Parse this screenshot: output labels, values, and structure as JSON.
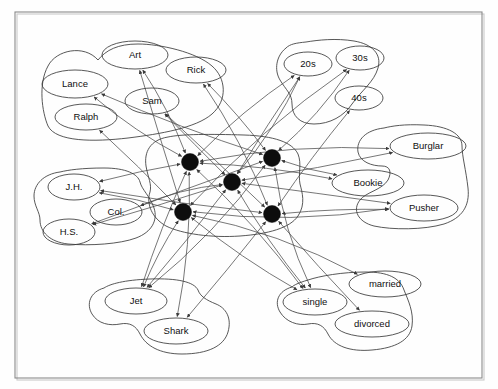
{
  "figure": {
    "frame": {
      "x": 15,
      "y": 12,
      "width": 467,
      "height": 366
    },
    "background_color": "#fefefe",
    "line_color": "#4a4a4a",
    "node_fill_color": "#0d0d0d",
    "ellipse_stroke_color": "#3a3a3a"
  },
  "clusters": [
    {
      "id": "names",
      "name": "name-cluster",
      "hull": "M 98 60 C 84 44 56 50 48 66 C 38 84 42 112 48 126 C 56 142 94 142 128 138 C 160 134 196 128 212 114 C 228 100 226 78 212 66 C 196 52 160 44 138 44 C 118 44 106 50 98 60 Z",
      "nodes": [
        {
          "id": "art",
          "label": "Art",
          "cx": 135,
          "cy": 55,
          "rx": 33,
          "ry": 14
        },
        {
          "id": "rick",
          "label": "Rick",
          "cx": 196,
          "cy": 70,
          "rx": 30,
          "ry": 13
        },
        {
          "id": "lance",
          "label": "Lance",
          "cx": 75,
          "cy": 84,
          "rx": 33,
          "ry": 14
        },
        {
          "id": "sam",
          "label": "Sam",
          "cx": 152,
          "cy": 101,
          "rx": 27,
          "ry": 13
        },
        {
          "id": "ralph",
          "label": "Ralph",
          "cx": 86,
          "cy": 117,
          "rx": 31,
          "ry": 13
        }
      ]
    },
    {
      "id": "age",
      "name": "age-cluster",
      "hull": "M 286 48 C 276 56 274 70 280 80 C 286 90 292 94 292 104 C 292 116 300 124 314 124 C 330 124 344 116 352 104 C 362 90 374 82 378 68 C 382 54 372 44 354 41 C 336 38 318 40 306 42 C 296 43 290 44 286 48 Z",
      "nodes": [
        {
          "id": "20s",
          "label": "20s",
          "cx": 308,
          "cy": 64,
          "rx": 24,
          "ry": 12
        },
        {
          "id": "30s",
          "label": "30s",
          "cx": 360,
          "cy": 58,
          "rx": 24,
          "ry": 12
        },
        {
          "id": "40s",
          "label": "40s",
          "cx": 359,
          "cy": 98,
          "rx": 24,
          "ry": 12
        }
      ]
    },
    {
      "id": "occupation",
      "name": "occupation-cluster",
      "hull": "M 384 128 C 366 130 356 140 358 152 C 360 162 372 166 382 166 C 390 166 392 172 388 180 C 382 190 366 192 360 200 C 352 210 358 222 374 226 C 392 230 424 230 444 224 C 462 218 470 206 468 188 C 466 170 462 156 462 146 C 462 134 448 126 424 125 C 404 124 392 126 384 128 Z",
      "nodes": [
        {
          "id": "burglar",
          "label": "Burglar",
          "cx": 428,
          "cy": 146,
          "rx": 38,
          "ry": 13
        },
        {
          "id": "bookie",
          "label": "Bookie",
          "cx": 368,
          "cy": 183,
          "rx": 36,
          "ry": 13
        },
        {
          "id": "pusher",
          "label": "Pusher",
          "cx": 424,
          "cy": 208,
          "rx": 34,
          "ry": 13
        }
      ]
    },
    {
      "id": "education",
      "name": "education-cluster",
      "hull": "M 60 172 C 44 174 34 184 34 196 C 34 206 40 212 40 220 C 40 232 50 242 68 244 C 90 246 120 244 136 238 C 152 232 158 220 154 208 C 150 196 142 190 140 182 C 138 174 126 168 104 168 C 82 168 68 170 60 172 Z",
      "nodes": [
        {
          "id": "jh",
          "label": "J.H.",
          "cx": 74,
          "cy": 187,
          "rx": 26,
          "ry": 13
        },
        {
          "id": "col",
          "label": "Col.",
          "cx": 116,
          "cy": 212,
          "rx": 26,
          "ry": 13
        },
        {
          "id": "hs",
          "label": "H.S.",
          "cx": 69,
          "cy": 232,
          "rx": 26,
          "ry": 13
        }
      ]
    },
    {
      "id": "gang",
      "name": "gang-cluster",
      "hull": "M 104 288 C 90 292 86 304 92 314 C 98 324 110 326 120 324 C 130 322 136 326 140 334 C 146 346 160 354 182 354 C 208 354 224 346 228 332 C 232 318 226 308 216 304 C 206 300 200 296 198 290 C 194 282 178 278 150 279 C 124 280 110 284 104 288 Z",
      "nodes": [
        {
          "id": "jet",
          "label": "Jet",
          "cx": 136,
          "cy": 301,
          "rx": 31,
          "ry": 13
        },
        {
          "id": "shark",
          "label": "Shark",
          "cx": 176,
          "cy": 331,
          "rx": 32,
          "ry": 13
        }
      ]
    },
    {
      "id": "marital",
      "name": "marital-status-cluster",
      "hull": "M 292 287 C 278 291 274 302 280 312 C 286 322 298 326 308 324 C 318 322 324 326 328 334 C 334 346 350 352 372 350 C 396 348 410 340 412 326 C 414 312 408 300 404 290 C 400 278 388 272 366 272 C 342 272 320 276 308 280 C 298 283 294 285 292 287 Z",
      "nodes": [
        {
          "id": "single",
          "label": "single",
          "cx": 315,
          "cy": 302,
          "rx": 32,
          "ry": 13
        },
        {
          "id": "married",
          "label": "married",
          "cx": 385,
          "cy": 284,
          "rx": 36,
          "ry": 13
        },
        {
          "id": "divorced",
          "label": "divorced",
          "cx": 372,
          "cy": 324,
          "rx": 37,
          "ry": 13
        }
      ]
    },
    {
      "id": "instances",
      "name": "instance-unit-cluster",
      "hull": "M 168 137 C 150 140 144 152 146 166 C 148 178 152 184 150 192 C 146 204 152 218 166 226 C 182 234 212 238 240 236 C 268 234 290 228 298 216 C 306 204 302 192 300 184 C 298 174 302 164 298 154 C 292 142 274 136 244 135 C 210 134 182 134 168 137 Z",
      "nodes": [
        {
          "id": "hub-top-left",
          "label": "",
          "cx": 190,
          "cy": 162,
          "r": 8.5
        },
        {
          "id": "hub-top-right",
          "label": "",
          "cx": 272,
          "cy": 158,
          "r": 8.5
        },
        {
          "id": "hub-center",
          "label": "",
          "cx": 232,
          "cy": 182,
          "r": 8.5
        },
        {
          "id": "hub-bottom-left",
          "label": "",
          "cx": 183,
          "cy": 212,
          "r": 8.5
        },
        {
          "id": "hub-bottom-right",
          "label": "",
          "cx": 272,
          "cy": 214,
          "r": 8.5
        }
      ]
    }
  ],
  "edges": [
    {
      "from": "hub-top-left",
      "to": "art",
      "arrow": "to"
    },
    {
      "from": "hub-top-left",
      "to": "lance",
      "arrow": "to"
    },
    {
      "from": "hub-top-left",
      "to": "20s",
      "arrow": "to"
    },
    {
      "from": "hub-top-left",
      "to": "jet",
      "arrow": "to"
    },
    {
      "from": "hub-top-left",
      "to": "jh",
      "arrow": "to"
    },
    {
      "from": "hub-top-left",
      "to": "single",
      "arrow": "to"
    },
    {
      "from": "hub-top-left",
      "to": "burglar",
      "arrow": "to"
    },
    {
      "from": "hub-top-right",
      "to": "rick",
      "arrow": "to"
    },
    {
      "from": "hub-top-right",
      "to": "30s",
      "arrow": "to"
    },
    {
      "from": "hub-top-right",
      "to": "jet",
      "arrow": "to"
    },
    {
      "from": "hub-top-right",
      "to": "hs",
      "arrow": "to"
    },
    {
      "from": "hub-top-right",
      "to": "single",
      "arrow": "to"
    },
    {
      "from": "hub-top-right",
      "to": "bookie",
      "arrow": "to"
    },
    {
      "from": "hub-center",
      "to": "sam",
      "arrow": "to"
    },
    {
      "from": "hub-center",
      "to": "20s",
      "arrow": "to"
    },
    {
      "from": "hub-center",
      "to": "jet",
      "arrow": "to"
    },
    {
      "from": "hub-center",
      "to": "col",
      "arrow": "to"
    },
    {
      "from": "hub-center",
      "to": "single",
      "arrow": "to"
    },
    {
      "from": "hub-center",
      "to": "burglar",
      "arrow": "to"
    },
    {
      "from": "hub-center",
      "to": "pusher",
      "arrow": "to"
    },
    {
      "from": "hub-bottom-left",
      "to": "ralph",
      "arrow": "to"
    },
    {
      "from": "hub-bottom-left",
      "to": "30s",
      "arrow": "to"
    },
    {
      "from": "hub-bottom-left",
      "to": "jet",
      "arrow": "to"
    },
    {
      "from": "hub-bottom-left",
      "to": "jh",
      "arrow": "to"
    },
    {
      "from": "hub-bottom-left",
      "to": "married",
      "arrow": "to"
    },
    {
      "from": "hub-bottom-left",
      "to": "pusher",
      "arrow": "to"
    },
    {
      "from": "hub-bottom-right",
      "to": "rick",
      "arrow": "to"
    },
    {
      "from": "hub-bottom-right",
      "to": "40s",
      "arrow": "to"
    },
    {
      "from": "hub-bottom-right",
      "to": "shark",
      "arrow": "to"
    },
    {
      "from": "hub-bottom-right",
      "to": "jh",
      "arrow": "to"
    },
    {
      "from": "hub-bottom-right",
      "to": "divorced",
      "arrow": "to"
    },
    {
      "from": "hub-bottom-right",
      "to": "pusher",
      "arrow": "to"
    },
    {
      "from": "hub-top-left",
      "to": "shark",
      "arrow": "to"
    },
    {
      "from": "hub-center",
      "to": "20s",
      "arrow": "to"
    },
    {
      "from": "hub-top-right",
      "to": "lance",
      "arrow": "to"
    },
    {
      "from": "hub-bottom-left",
      "to": "art",
      "arrow": "to"
    },
    {
      "from": "hub-bottom-right",
      "to": "sam",
      "arrow": "to"
    },
    {
      "from": "hub-center",
      "to": "hs",
      "arrow": "to"
    },
    {
      "from": "hub-top-left",
      "to": "bookie",
      "arrow": "to"
    },
    {
      "from": "hub-bottom-left",
      "to": "single",
      "arrow": "to"
    }
  ]
}
